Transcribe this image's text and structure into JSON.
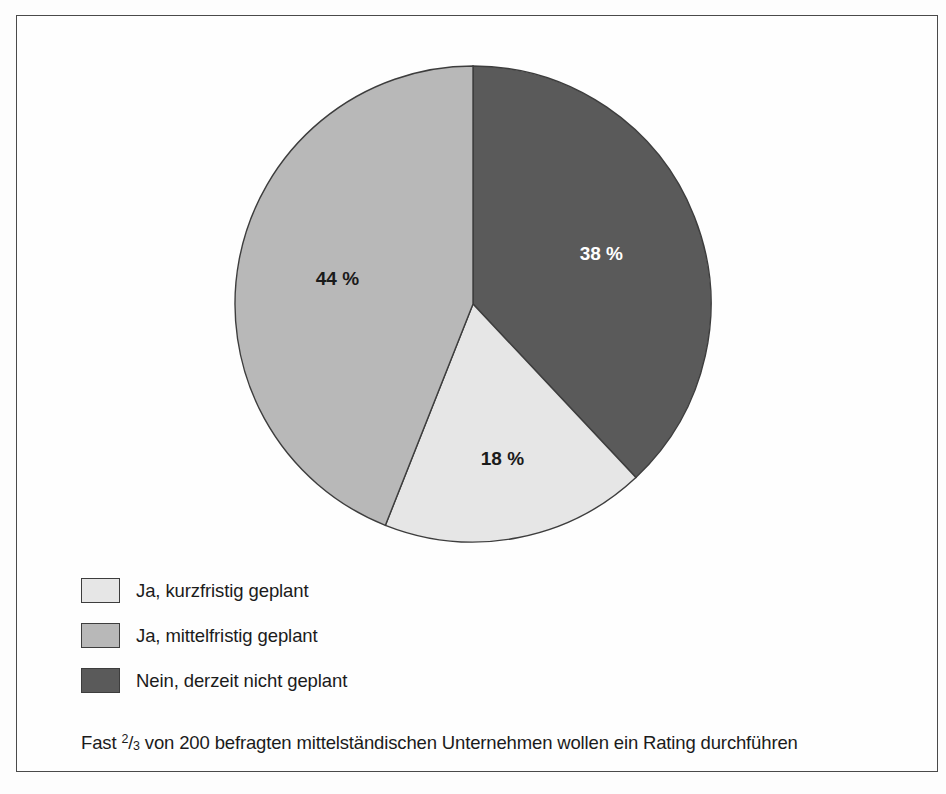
{
  "figure": {
    "border_color": "#4a4a4a",
    "background_color": "#fefefe"
  },
  "chart_data": {
    "type": "pie",
    "title": "",
    "subtitle": "",
    "xlabel": "",
    "ylabel": "",
    "legend_position": "bottom-left",
    "grid": false,
    "start_angle_deg": 0,
    "direction": "clockwise",
    "units": "%",
    "total_respondents": 200,
    "categories": [
      "Nein, derzeit nicht geplant",
      "Ja, kurzfristig geplant",
      "Ja, mittelfristig geplant"
    ],
    "values": [
      38,
      18,
      44
    ],
    "slices": [
      {
        "label": "Nein, derzeit nicht geplant",
        "value": 38,
        "value_label": "38 %",
        "color": "#5a5a5a",
        "text_color": "#ffffff",
        "order": 1
      },
      {
        "label": "Ja, kurzfristig geplant",
        "value": 18,
        "value_label": "18 %",
        "color": "#e6e6e6",
        "text_color": "#1b1b1b",
        "order": 2
      },
      {
        "label": "Ja, mittelfristig geplant",
        "value": 44,
        "value_label": "44 %",
        "color": "#b8b8b8",
        "text_color": "#1b1b1b",
        "order": 3
      }
    ],
    "annotations": [
      "Fast 2/3 von 200 befragten mittelständischen Unternehmen wollen ein Rating durchführen"
    ]
  },
  "legend": {
    "items": [
      {
        "label": "Ja, kurzfristig geplant",
        "color": "#e6e6e6"
      },
      {
        "label": "Ja, mittelfristig geplant",
        "color": "#b8b8b8"
      },
      {
        "label": "Nein, derzeit nicht geplant",
        "color": "#5a5a5a"
      }
    ]
  },
  "caption": {
    "prefix": "Fast ",
    "fraction_numerator": "2",
    "fraction_separator": "/",
    "fraction_denominator": "3",
    "suffix": " von 200 befragten mittelständischen Unternehmen wollen ein Rating durchführen"
  }
}
